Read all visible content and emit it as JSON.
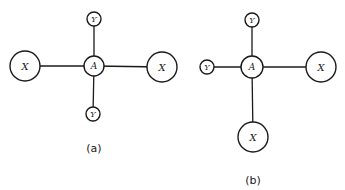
{
  "figure": {
    "width": 345,
    "height": 190,
    "stroke_color": "#1a1a1a",
    "background": "#ffffff"
  },
  "panels": [
    {
      "id": "a",
      "label": "(a)",
      "label_pos": [
        94,
        148
      ],
      "nodes": [
        {
          "id": "A",
          "label": "A",
          "cx": 94,
          "cy": 66,
          "r": 10,
          "font_size": 9
        },
        {
          "id": "X_left",
          "label": "X",
          "cx": 25,
          "cy": 66,
          "r": 15,
          "font_size": 10
        },
        {
          "id": "X_right",
          "label": "X",
          "cx": 162,
          "cy": 67,
          "r": 15,
          "font_size": 10
        },
        {
          "id": "Y_top",
          "label": "Y",
          "cx": 94,
          "cy": 19,
          "r": 7,
          "font_size": 8
        },
        {
          "id": "Y_bottom",
          "label": "Y",
          "cx": 93,
          "cy": 114,
          "r": 7,
          "font_size": 8
        }
      ],
      "edges": [
        [
          "A",
          "X_left"
        ],
        [
          "A",
          "X_right"
        ],
        [
          "A",
          "Y_top"
        ],
        [
          "A",
          "Y_bottom"
        ]
      ]
    },
    {
      "id": "b",
      "label": "(b)",
      "label_pos": [
        253,
        180
      ],
      "nodes": [
        {
          "id": "A",
          "label": "A",
          "cx": 252,
          "cy": 67,
          "r": 11,
          "font_size": 9
        },
        {
          "id": "Y_top",
          "label": "Y",
          "cx": 252,
          "cy": 20,
          "r": 7,
          "font_size": 8
        },
        {
          "id": "Y_left",
          "label": "Y",
          "cx": 207,
          "cy": 67,
          "r": 7,
          "font_size": 8
        },
        {
          "id": "X_right",
          "label": "X",
          "cx": 321,
          "cy": 67,
          "r": 15,
          "font_size": 10
        },
        {
          "id": "X_bottom",
          "label": "X",
          "cx": 253,
          "cy": 137,
          "r": 15,
          "font_size": 10
        }
      ],
      "edges": [
        [
          "A",
          "Y_top"
        ],
        [
          "A",
          "Y_left"
        ],
        [
          "A",
          "X_right"
        ],
        [
          "A",
          "X_bottom"
        ]
      ]
    }
  ]
}
